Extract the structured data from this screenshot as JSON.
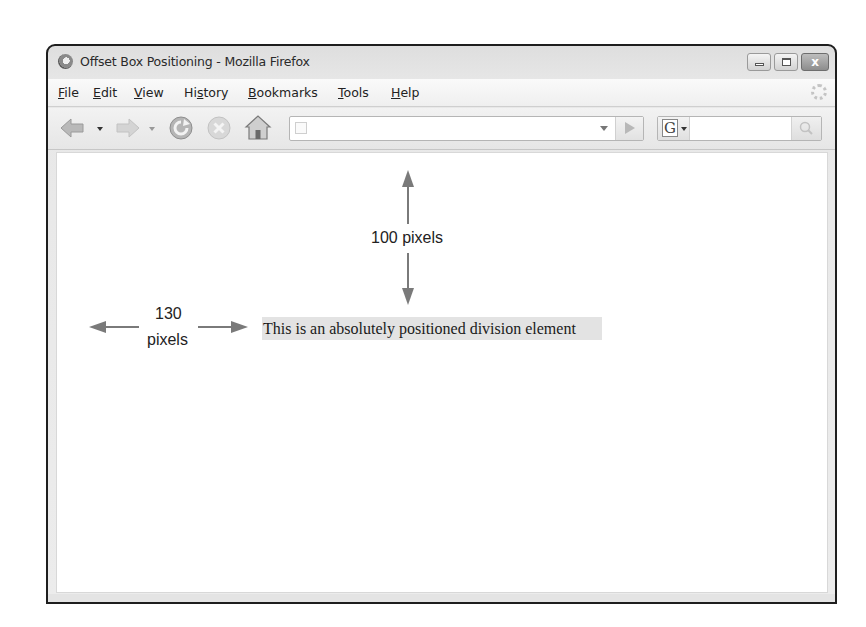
{
  "window": {
    "title": "Offset Box Positioning - Mozilla Firefox",
    "controls": [
      "minimize",
      "maximize",
      "close"
    ],
    "close_glyph": "x"
  },
  "menubar": {
    "items": [
      {
        "label": "File",
        "accel": "F"
      },
      {
        "label": "Edit",
        "accel": "E"
      },
      {
        "label": "View",
        "accel": "V"
      },
      {
        "label": "History",
        "accel": "s"
      },
      {
        "label": "Bookmarks",
        "accel": "B"
      },
      {
        "label": "Tools",
        "accel": "T"
      },
      {
        "label": "Help",
        "accel": "H"
      }
    ]
  },
  "navbar": {
    "icons": [
      "back-icon",
      "forward-icon",
      "reload-icon",
      "stop-icon",
      "home-icon"
    ],
    "url_value": "",
    "search_engine_glyph": "G",
    "search_value": ""
  },
  "content": {
    "div_text": "This is an absolutely positioned division element",
    "div_bg": "#e3e3e3",
    "vertical_annotation": "100 pixels",
    "horizontal_annotation_line1": "130",
    "horizontal_annotation_line2": "pixels",
    "arrow_color": "#7a7a7a"
  }
}
